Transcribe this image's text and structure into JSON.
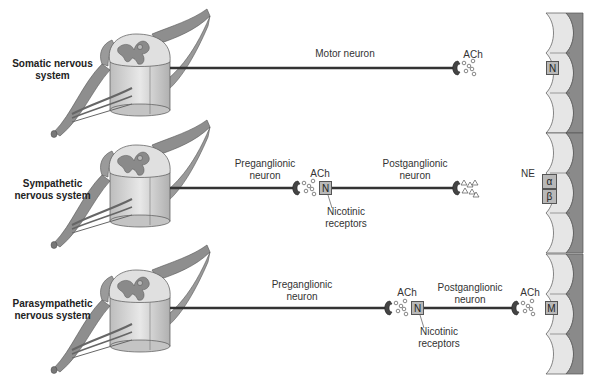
{
  "rows": [
    {
      "system": "Somatic nervous system",
      "system_lines": [
        "Somatic nervous",
        "system"
      ],
      "neurons": [
        {
          "label": "Motor neuron"
        }
      ],
      "junctions": [
        {
          "neurotransmitter": "ACh",
          "receptor": "N",
          "location": "effector"
        }
      ]
    },
    {
      "system": "Sympathetic nervous system",
      "system_lines": [
        "Sympathetic",
        "nervous system"
      ],
      "neurons": [
        {
          "label_lines": [
            "Preganglionic",
            "neuron"
          ]
        },
        {
          "label_lines": [
            "Postganglionic",
            "neuron"
          ]
        }
      ],
      "junctions": [
        {
          "neurotransmitter": "ACh",
          "receptor": "N",
          "location": "ganglion",
          "callout": [
            "Nicotinic",
            "receptors"
          ]
        },
        {
          "neurotransmitter": "NE",
          "receptors": [
            "α",
            "β"
          ],
          "location": "effector"
        }
      ]
    },
    {
      "system": "Parasympathetic nervous system",
      "system_lines": [
        "Parasympathetic",
        "nervous system"
      ],
      "neurons": [
        {
          "label_lines": [
            "Preganglionic",
            "neuron"
          ]
        },
        {
          "label_lines": [
            "Postganglionic",
            "neuron"
          ]
        }
      ],
      "junctions": [
        {
          "neurotransmitter": "ACh",
          "receptor": "N",
          "location": "ganglion",
          "callout": [
            "Nicotinic",
            "receptors"
          ]
        },
        {
          "neurotransmitter": "ACh",
          "receptor": "M",
          "location": "effector"
        }
      ]
    }
  ],
  "colors": {
    "axon": "#333333",
    "terminal": "#444444",
    "receptor": "#b8b8b8",
    "effector_light": "#e6e6e6",
    "effector_dark": "#8a8a8a",
    "cord_gray": "#9a9a9a",
    "cord_light": "#dcdcdc"
  }
}
